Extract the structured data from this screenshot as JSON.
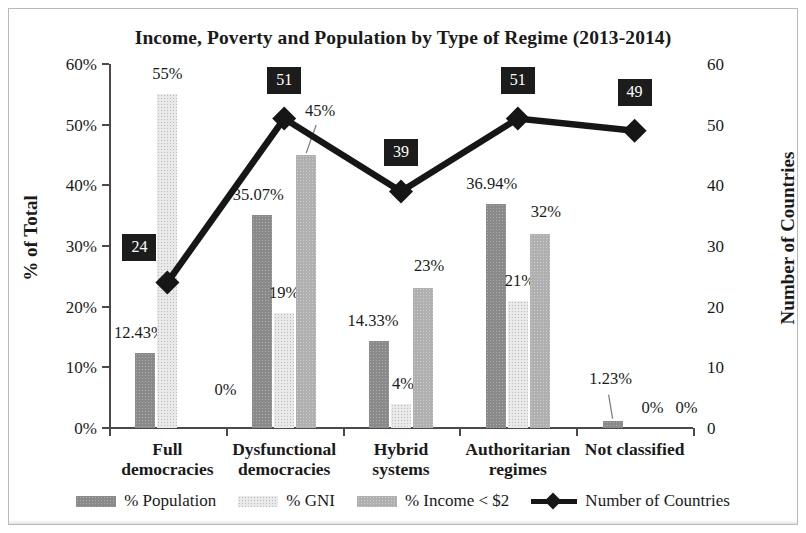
{
  "chart_data": {
    "type": "bar",
    "title": "Income, Poverty and Population by Type of Regime (2013-2014)",
    "xlabel": "",
    "ylabel": "% of Total",
    "y2label": "Number of Countries",
    "ylim": [
      0,
      60
    ],
    "y2lim": [
      0,
      60
    ],
    "yticks": [
      "0%",
      "10%",
      "20%",
      "30%",
      "40%",
      "50%",
      "60%"
    ],
    "y2ticks": [
      "0",
      "10",
      "20",
      "30",
      "40",
      "50",
      "60"
    ],
    "grid": false,
    "legend_position": "bottom",
    "categories": [
      "Full democracies",
      "Dysfunctional democracies",
      "Hybrid systems",
      "Authoritarian regimes",
      "Not classified"
    ],
    "category_lines": [
      [
        "Full",
        "democracies"
      ],
      [
        "Dysfunctional",
        "democracies"
      ],
      [
        "Hybrid",
        "systems"
      ],
      [
        "Authoritarian",
        "regimes"
      ],
      [
        "Not classified"
      ]
    ],
    "series": [
      {
        "name": "% Population",
        "kind": "bar",
        "color": "#8a8a8a",
        "axis": "left",
        "values": [
          12.43,
          35.07,
          14.33,
          36.94,
          1.23
        ],
        "labels": [
          "12.43%",
          "35.07%",
          "14.33%",
          "36.94%",
          "1.23%"
        ]
      },
      {
        "name": "% GNI",
        "kind": "bar",
        "color": "#e9e9e9",
        "axis": "left",
        "values": [
          55,
          19,
          4,
          21,
          0
        ],
        "labels": [
          "55%",
          "19%",
          "4%",
          "21%",
          "0%"
        ]
      },
      {
        "name": "% Income < $2",
        "kind": "bar",
        "color": "#b0b0b0",
        "axis": "left",
        "values": [
          0,
          45,
          23,
          32,
          0
        ],
        "labels": [
          "0%",
          "45%",
          "23%",
          "32%",
          "0%"
        ]
      },
      {
        "name": "Number of Countries",
        "kind": "line",
        "color": "#161616",
        "axis": "right",
        "values": [
          24,
          51,
          39,
          51,
          49
        ],
        "labels": [
          "24",
          "51",
          "39",
          "51",
          "49"
        ]
      }
    ]
  },
  "legend": {
    "items": [
      {
        "label": "% Population",
        "swatch": "bar-pop"
      },
      {
        "label": "% GNI",
        "swatch": "bar-gni"
      },
      {
        "label": "% Income < $2",
        "swatch": "bar-inc"
      },
      {
        "label": "Number of Countries",
        "swatch": "line-marker"
      }
    ]
  }
}
